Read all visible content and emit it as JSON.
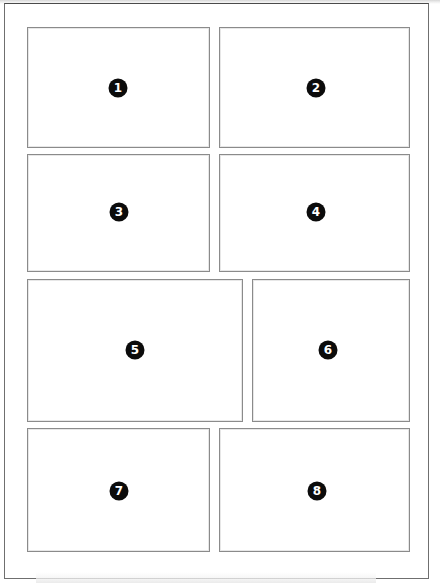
{
  "page": {
    "background_color": "#ffffff",
    "frame_color": "#6f6f6f",
    "panel_border_color": "#8b8b8b",
    "badge_color": "#0b0b0b",
    "badge_text_color": "#ffffff",
    "width": 440,
    "height": 585
  },
  "panels": [
    {
      "label": "1",
      "x": 27,
      "y": 27,
      "w": 183,
      "h": 121,
      "badge_x": 117,
      "badge_y": 87
    },
    {
      "label": "2",
      "x": 219,
      "y": 27,
      "w": 191,
      "h": 121,
      "badge_x": 315,
      "badge_y": 87
    },
    {
      "label": "3",
      "x": 27,
      "y": 154,
      "w": 183,
      "h": 118,
      "badge_x": 118,
      "badge_y": 211
    },
    {
      "label": "4",
      "x": 219,
      "y": 154,
      "w": 191,
      "h": 118,
      "badge_x": 315,
      "badge_y": 211
    },
    {
      "label": "5",
      "x": 27,
      "y": 279,
      "w": 216,
      "h": 143,
      "badge_x": 134,
      "badge_y": 349
    },
    {
      "label": "6",
      "x": 252,
      "y": 279,
      "w": 158,
      "h": 143,
      "badge_x": 327,
      "badge_y": 349
    },
    {
      "label": "7",
      "x": 27,
      "y": 428,
      "w": 183,
      "h": 124,
      "badge_x": 118,
      "badge_y": 490
    },
    {
      "label": "8",
      "x": 219,
      "y": 428,
      "w": 191,
      "h": 124,
      "badge_x": 316,
      "badge_y": 490
    }
  ]
}
